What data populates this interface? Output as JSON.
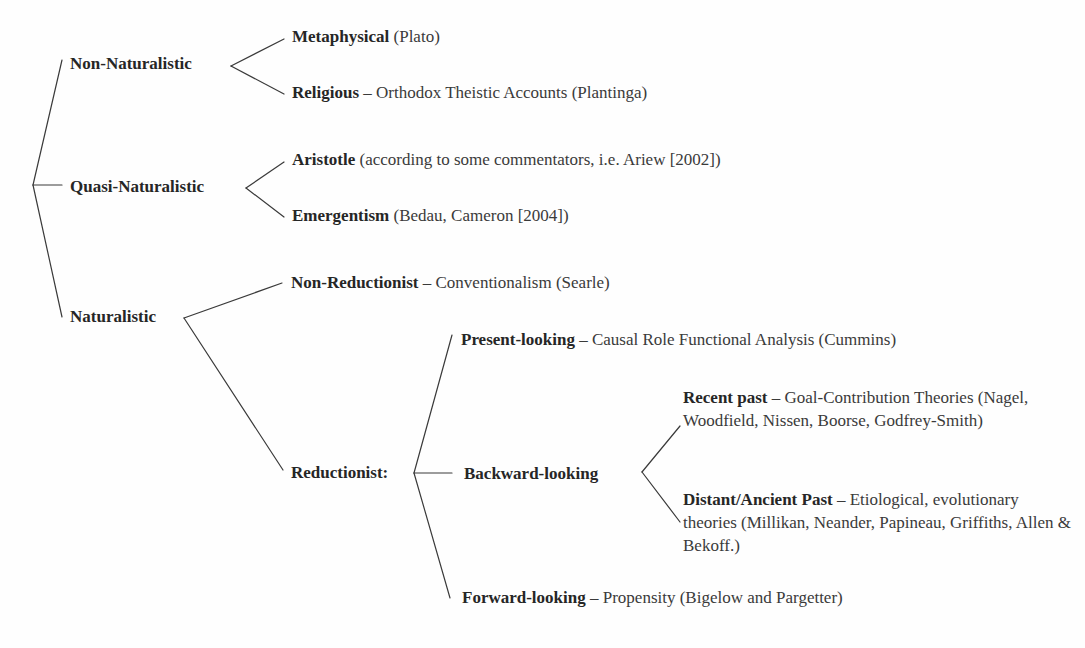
{
  "diagram": {
    "type": "taxonomy-tree",
    "level1": [
      {
        "label": "Non-Naturalistic"
      },
      {
        "label": "Quasi-Naturalistic"
      },
      {
        "label": "Naturalistic"
      }
    ],
    "non_naturalistic": {
      "children": [
        {
          "bold": "Metaphysical",
          "rest": " (Plato)"
        },
        {
          "bold": "Religious",
          "rest": " – Orthodox Theistic Accounts (Plantinga)"
        }
      ]
    },
    "quasi_naturalistic": {
      "children": [
        {
          "bold": "Aristotle",
          "rest": " (according to some commentators, i.e. Ariew [2002])"
        },
        {
          "bold": "Emergentism",
          "rest": " (Bedau, Cameron [2004])"
        }
      ]
    },
    "naturalistic": {
      "non_reductionist": {
        "bold": "Non-Reductionist",
        "rest": " – Conventionalism (Searle)"
      },
      "reductionist": {
        "label": "Reductionist:",
        "present": {
          "bold": "Present-looking",
          "rest": " – Causal Role Functional Analysis (Cummins)"
        },
        "backward": {
          "label": "Backward-looking",
          "recent": {
            "bold": "Recent past",
            "rest": " – Goal-Contribution Theories (Nagel, Woodfield, Nissen, Boorse, Godfrey-Smith)"
          },
          "distant": {
            "bold": "Distant/Ancient Past",
            "rest": " – Etiological, evolutionary theories (Millikan, Neander, Papineau, Griffiths, Allen & Bekoff.)"
          }
        },
        "forward": {
          "bold": "Forward-looking",
          "rest": " – Propensity (Bigelow and Pargetter)"
        }
      }
    }
  }
}
